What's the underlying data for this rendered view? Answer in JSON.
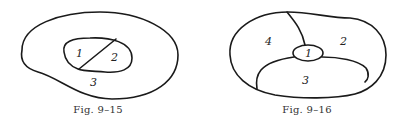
{
  "figures": [
    {
      "caption": "Fig. 9–15",
      "regions": [
        {
          "label": "1"
        },
        {
          "label": "2"
        },
        {
          "label": "3"
        }
      ]
    },
    {
      "caption": "Fig. 9–16",
      "regions": [
        {
          "label": "1"
        },
        {
          "label": "2"
        },
        {
          "label": "3"
        },
        {
          "label": "4"
        }
      ]
    }
  ]
}
